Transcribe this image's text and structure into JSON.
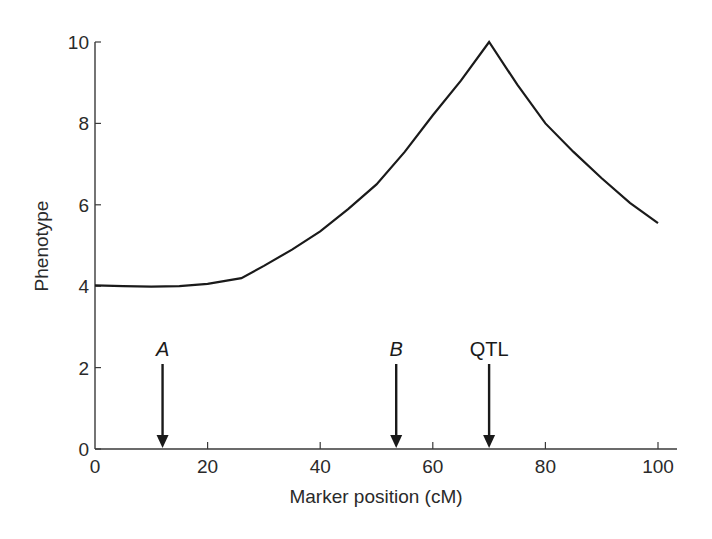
{
  "chart_data": {
    "type": "line",
    "title": "",
    "xlabel": "Marker position (cM)",
    "ylabel": "Phenotype",
    "xlim": [
      0,
      100
    ],
    "ylim": [
      0,
      10
    ],
    "x_ticks": [
      0,
      20,
      40,
      60,
      80,
      100
    ],
    "y_ticks": [
      0,
      2,
      4,
      6,
      8,
      10
    ],
    "grid": false,
    "legend": null,
    "series": [
      {
        "name": "Phenotype vs marker position",
        "x": [
          0,
          5,
          10,
          15,
          20,
          26,
          30,
          35,
          40,
          45,
          50,
          55,
          60,
          65,
          70,
          75,
          80,
          85,
          90,
          95,
          100
        ],
        "y": [
          4.02,
          4.0,
          3.99,
          4.0,
          4.06,
          4.2,
          4.5,
          4.9,
          5.35,
          5.9,
          6.5,
          7.3,
          8.2,
          9.05,
          10.0,
          8.95,
          8.0,
          7.3,
          6.65,
          6.05,
          5.55
        ]
      }
    ],
    "annotations": [
      {
        "label": "A",
        "x": 12,
        "italic": true,
        "type": "arrow-down"
      },
      {
        "label": "B",
        "x": 53.5,
        "italic": true,
        "type": "arrow-down"
      },
      {
        "label": "QTL",
        "x": 70,
        "italic": false,
        "type": "arrow-down"
      }
    ]
  },
  "axes": {
    "x_title": "Marker position (cM)",
    "y_title": "Phenotype"
  },
  "colors": {
    "line": "#1a1a1a",
    "axis": "#3a3a3a",
    "background": "#ffffff"
  }
}
